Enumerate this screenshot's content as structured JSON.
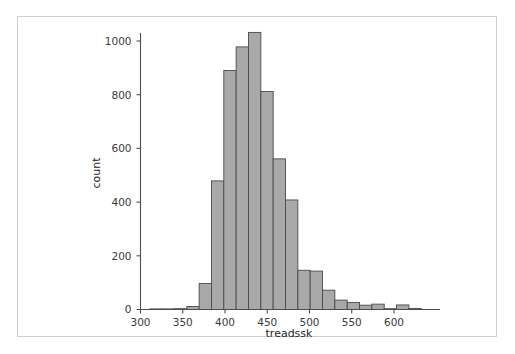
{
  "figure": {
    "width": 515,
    "height": 354,
    "background_color": "#ffffff",
    "frame_border_color": "#cfcfcf"
  },
  "chart_data": {
    "type": "bar",
    "subtype": "histogram",
    "title": "",
    "xlabel": "treadssk",
    "ylabel": "count",
    "xlim": [
      295,
      640
    ],
    "ylim": [
      0,
      1075
    ],
    "grid": false,
    "legend": null,
    "bin_width": 14.6,
    "bar_fill_color": "#a9a9a9",
    "bar_edge_color": "#4a4a4a",
    "xticks": [
      300,
      350,
      400,
      450,
      500,
      550,
      600
    ],
    "xtick_labels": [
      "300",
      "350",
      "400",
      "450",
      "500",
      "550",
      "600"
    ],
    "yticks": [
      0,
      200,
      400,
      600,
      800,
      1000
    ],
    "ytick_labels": [
      "0",
      "200",
      "400",
      "600",
      "800",
      "1000"
    ],
    "bins": [
      {
        "left": 311.0,
        "right": 325.6,
        "center": 318.3,
        "count": 1
      },
      {
        "left": 325.6,
        "right": 340.2,
        "center": 332.9,
        "count": 2
      },
      {
        "left": 340.2,
        "right": 354.8,
        "center": 347.5,
        "count": 3
      },
      {
        "left": 354.8,
        "right": 369.4,
        "center": 362.1,
        "count": 11
      },
      {
        "left": 369.4,
        "right": 384.0,
        "center": 376.7,
        "count": 97
      },
      {
        "left": 384.0,
        "right": 398.6,
        "center": 391.3,
        "count": 479
      },
      {
        "left": 398.6,
        "right": 413.2,
        "center": 405.9,
        "count": 890
      },
      {
        "left": 413.2,
        "right": 427.8,
        "center": 420.5,
        "count": 978
      },
      {
        "left": 427.8,
        "right": 442.4,
        "center": 435.1,
        "count": 1032
      },
      {
        "left": 442.4,
        "right": 457.0,
        "center": 449.7,
        "count": 812
      },
      {
        "left": 457.0,
        "right": 471.6,
        "center": 464.3,
        "count": 561
      },
      {
        "left": 471.6,
        "right": 486.2,
        "center": 478.9,
        "count": 408
      },
      {
        "left": 486.2,
        "right": 500.8,
        "center": 493.5,
        "count": 146
      },
      {
        "left": 500.8,
        "right": 515.4,
        "center": 508.1,
        "count": 143
      },
      {
        "left": 515.4,
        "right": 530.0,
        "center": 522.7,
        "count": 72
      },
      {
        "left": 530.0,
        "right": 544.6,
        "center": 537.3,
        "count": 35
      },
      {
        "left": 544.6,
        "right": 559.2,
        "center": 551.9,
        "count": 26
      },
      {
        "left": 559.2,
        "right": 573.8,
        "center": 566.5,
        "count": 16
      },
      {
        "left": 573.8,
        "right": 588.4,
        "center": 581.1,
        "count": 20
      },
      {
        "left": 588.4,
        "right": 603.0,
        "center": 595.7,
        "count": 3
      },
      {
        "left": 603.0,
        "right": 617.6,
        "center": 610.3,
        "count": 17
      },
      {
        "left": 617.6,
        "right": 632.2,
        "center": 624.9,
        "count": 4
      }
    ]
  }
}
